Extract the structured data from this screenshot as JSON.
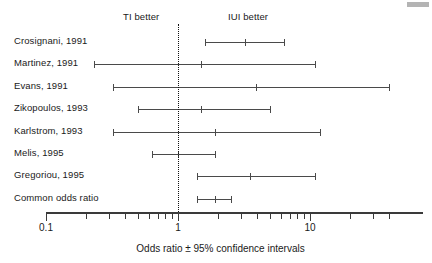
{
  "figure": {
    "headers": {
      "left": "TI better",
      "right": "IUI better"
    },
    "axis_caption": "Odds ratio ± 95% confidence intervals"
  },
  "chart_data": {
    "type": "scatter",
    "subtype": "forest-plot",
    "title": "",
    "xlabel": "Odds ratio ± 95% confidence intervals",
    "ylabel": "",
    "xscale": "log",
    "xlim": [
      0.1,
      50
    ],
    "grid": false,
    "legend": null,
    "null_value": 1,
    "annotations": [
      {
        "text": "TI better",
        "side": "left-of-null"
      },
      {
        "text": "IUI better",
        "side": "right-of-null"
      }
    ],
    "xticks_labeled": [
      0.1,
      1,
      10
    ],
    "xtick_labels": [
      "0.1",
      "1",
      "10"
    ],
    "xticks_minor": [
      0.2,
      0.3,
      0.4,
      0.5,
      0.6,
      0.7,
      0.8,
      0.9,
      2,
      3,
      4,
      5,
      6,
      7,
      8,
      9,
      20,
      30,
      40
    ],
    "categories": [
      "Crosignani, 1991",
      "Martinez, 1991",
      "Evans, 1991",
      "Zikopoulos, 1993",
      "Karlstrom, 1993",
      "Melis, 1995",
      "Gregoriou, 1995",
      "Common odds ratio"
    ],
    "studies": [
      {
        "label": "Crosignani, 1991",
        "odds_ratio": 3.2,
        "ci_low": 1.6,
        "ci_high": 6.4,
        "summary": false
      },
      {
        "label": "Martinez, 1991",
        "odds_ratio": 1.5,
        "ci_low": 0.23,
        "ci_high": 11.0,
        "summary": false
      },
      {
        "label": "Evans, 1991",
        "odds_ratio": 3.9,
        "ci_low": 0.32,
        "ci_high": 40.0,
        "summary": false
      },
      {
        "label": "Zikopoulos, 1993",
        "odds_ratio": 1.5,
        "ci_low": 0.5,
        "ci_high": 5.0,
        "summary": false
      },
      {
        "label": "Karlstrom, 1993",
        "odds_ratio": 1.9,
        "ci_low": 0.32,
        "ci_high": 12.0,
        "summary": false
      },
      {
        "label": "Melis, 1995",
        "odds_ratio": 1.0,
        "ci_low": 0.63,
        "ci_high": 1.9,
        "summary": false
      },
      {
        "label": "Gregoriou, 1995",
        "odds_ratio": 3.5,
        "ci_low": 1.4,
        "ci_high": 11.0,
        "summary": false
      },
      {
        "label": "Common odds ratio",
        "odds_ratio": 1.9,
        "ci_low": 1.4,
        "ci_high": 2.5,
        "summary": true
      }
    ]
  }
}
